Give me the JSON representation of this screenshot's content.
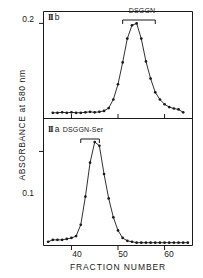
{
  "figure": {
    "ylabel": "ABSORBANCE at 580 nm",
    "xlabel": "FRACTION NUMBER",
    "line_color": "#1a1a1a",
    "marker_color": "#1a1a1a"
  },
  "panels": {
    "upper": {
      "tag_numeral": "II",
      "tag_letter": "b",
      "bracket_label": "DSGGN",
      "ytick_label": "0.2"
    },
    "lower": {
      "tag_numeral": "II",
      "tag_letter": "a",
      "bracket_label": "DSGGN-Ser",
      "ytick_label": "0.1"
    }
  },
  "xticks": [
    {
      "value": 40,
      "label": "40"
    },
    {
      "value": 50,
      "label": "50"
    },
    {
      "value": 60,
      "label": "60"
    }
  ],
  "chart_data": [
    {
      "type": "line",
      "panel": "II b",
      "title": "II b",
      "xlabel": "FRACTION NUMBER",
      "ylabel": "ABSORBANCE at 580 nm",
      "xlim": [
        34,
        66
      ],
      "ylim": [
        0.0,
        0.225
      ],
      "yticks": [
        0.2
      ],
      "xticks": [
        40,
        50,
        60
      ],
      "grid": false,
      "legend": null,
      "annotation": {
        "text": "DSGGN",
        "x_start": 51,
        "x_end": 58
      },
      "x": [
        36,
        37,
        38,
        39,
        40,
        41,
        42,
        43,
        44,
        45,
        46,
        47,
        48,
        49,
        50,
        51,
        52,
        53,
        54,
        55,
        56,
        57,
        58,
        59,
        60,
        61,
        62,
        63,
        64
      ],
      "values": [
        0.012,
        0.012,
        0.013,
        0.012,
        0.013,
        0.012,
        0.012,
        0.013,
        0.014,
        0.013,
        0.014,
        0.016,
        0.022,
        0.04,
        0.072,
        0.118,
        0.168,
        0.196,
        0.2,
        0.168,
        0.12,
        0.084,
        0.055,
        0.04,
        0.03,
        0.024,
        0.021,
        0.019,
        0.013
      ]
    },
    {
      "type": "line",
      "panel": "II a",
      "title": "II a",
      "xlabel": "FRACTION NUMBER",
      "ylabel": "ABSORBANCE at 580 nm",
      "xlim": [
        34,
        66
      ],
      "ylim": [
        0.0,
        0.135
      ],
      "yticks": [
        0.1
      ],
      "xticks": [
        40,
        50,
        60
      ],
      "grid": false,
      "legend": null,
      "annotation": {
        "text": "DSGGN-Ser",
        "x_start": 42,
        "x_end": 46
      },
      "x": [
        35,
        36,
        37,
        38,
        39,
        40,
        41,
        42,
        43,
        44,
        45,
        46,
        47,
        48,
        49,
        50,
        51,
        52,
        53,
        54,
        55,
        56,
        57,
        58,
        59,
        60,
        61,
        62,
        63,
        64,
        65
      ],
      "values": [
        0.004,
        0.006,
        0.006,
        0.006,
        0.007,
        0.008,
        0.01,
        0.022,
        0.052,
        0.088,
        0.11,
        0.106,
        0.076,
        0.05,
        0.03,
        0.016,
        0.008,
        0.005,
        0.004,
        0.003,
        0.003,
        0.003,
        0.003,
        0.003,
        0.003,
        0.003,
        0.003,
        0.003,
        0.003,
        0.003,
        0.003
      ]
    }
  ]
}
